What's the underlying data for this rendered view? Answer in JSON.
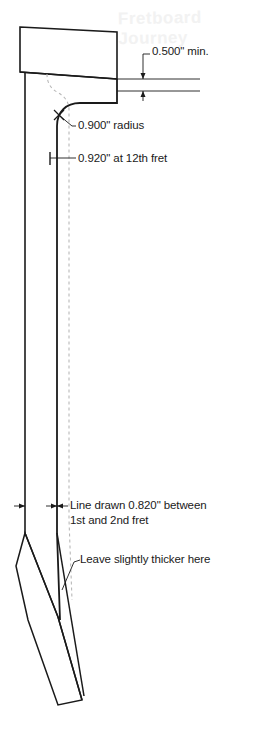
{
  "drawing": {
    "title": "Guitar Neck Side Profile",
    "subject": "neck-thickness-dimensions",
    "watermark_text": "Fretboard Journey",
    "colors": {
      "line": "#1a1a1a",
      "centerline": "#b8b8b8",
      "background": "#ffffff",
      "text": "#1a1a1a",
      "watermark": "#f2f2f2"
    },
    "annotations": [
      {
        "id": "headstock-thickness",
        "name": "dimension-0500-min",
        "text": "0.500\" min.",
        "value": "0.500",
        "unit": "in",
        "qualifier": "min.",
        "x": 152,
        "y": 50
      },
      {
        "id": "transition-radius",
        "name": "dimension-0900-radius",
        "text": "0.900\" radius",
        "value": "0.900",
        "unit": "in",
        "qualifier": "radius",
        "x": 78,
        "y": 108
      },
      {
        "id": "twelfth-fret-thickness",
        "name": "dimension-0920-12th-fret",
        "text": "0.920\" at 12th fret",
        "value": "0.920",
        "unit": "in",
        "qualifier": "at 12th fret",
        "x": 78,
        "y": 150
      },
      {
        "id": "first-second-fret-line",
        "name": "dimension-0820-between-frets",
        "text_line1": "Line drawn 0.820\" between",
        "text_line2": "1st and 2nd fret",
        "value": "0.820",
        "unit": "in",
        "x": 70,
        "y": 498
      },
      {
        "id": "heel-note",
        "name": "note-leave-thicker",
        "text": "Leave slightly thicker here",
        "x": 70,
        "y": 552
      }
    ]
  }
}
